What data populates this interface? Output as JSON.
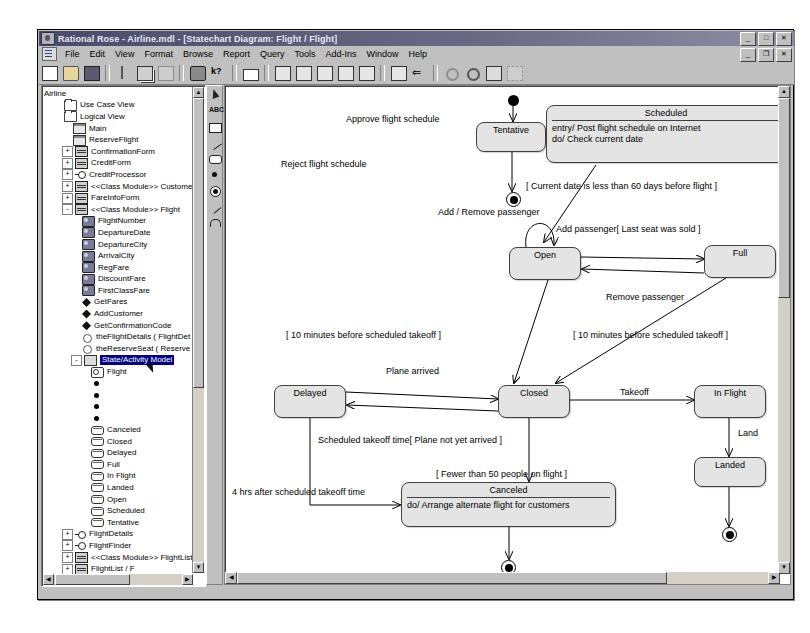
{
  "window": {
    "title": "Rational Rose - Airline.mdl - [Statechart Diagram: Flight / Flight]",
    "minimize": "_",
    "maximize": "□",
    "close": "✕",
    "mdi_minimize": "_",
    "mdi_restore": "❐",
    "mdi_close": "✕"
  },
  "menubar": {
    "items": [
      "File",
      "Edit",
      "View",
      "Format",
      "Browse",
      "Report",
      "Query",
      "Tools",
      "Add-Ins",
      "Window",
      "Help"
    ]
  },
  "toolbar": {
    "buttons": [
      {
        "name": "new-icon",
        "glyph": "new"
      },
      {
        "name": "open-icon",
        "glyph": "open"
      },
      {
        "name": "save-icon",
        "glyph": "save"
      },
      {
        "name": "cut-icon",
        "glyph": "cut"
      },
      {
        "name": "copy-icon",
        "glyph": "copy"
      },
      {
        "name": "paste-icon",
        "glyph": "paste"
      },
      {
        "name": "print-icon",
        "glyph": "print"
      },
      {
        "name": "context-help-icon",
        "glyph": "help"
      },
      {
        "name": "browse-class-icon",
        "glyph": "rect"
      },
      {
        "name": "browse-use-case-diagram-icon",
        "glyph": "diag1"
      },
      {
        "name": "browse-class-diagram-icon",
        "glyph": "diag2"
      },
      {
        "name": "browse-state-machine-diagram-icon",
        "glyph": "diag3"
      },
      {
        "name": "browse-interaction-diagram-icon",
        "glyph": "diag4"
      },
      {
        "name": "browse-component-diagram-icon",
        "glyph": "diag5"
      },
      {
        "name": "browse-parent-icon",
        "glyph": "parent"
      },
      {
        "name": "browse-previous-diagram-icon",
        "glyph": "back"
      },
      {
        "name": "zoom-in-icon",
        "glyph": "zoomin"
      },
      {
        "name": "zoom-out-icon",
        "glyph": "zoomout"
      },
      {
        "name": "fit-in-window-icon",
        "glyph": "fit"
      },
      {
        "name": "undo-fit-icon",
        "glyph": "undofit"
      }
    ]
  },
  "palette": {
    "tools": [
      {
        "name": "selection-tool",
        "glyph": "arrow"
      },
      {
        "name": "text-tool",
        "glyph": "abc"
      },
      {
        "name": "note-tool",
        "glyph": "note"
      },
      {
        "name": "anchor-note-tool",
        "glyph": "line"
      },
      {
        "name": "state-tool",
        "glyph": "state"
      },
      {
        "name": "start-state-tool",
        "glyph": "startstate"
      },
      {
        "name": "end-state-tool",
        "glyph": "endstate"
      },
      {
        "name": "state-transition-tool",
        "glyph": "transition"
      },
      {
        "name": "transition-to-self-tool",
        "glyph": "selftransition"
      }
    ]
  },
  "browser": {
    "root": "Airline",
    "nodes": [
      {
        "label": "Airline",
        "icon": "none",
        "indent": 0,
        "expander": "",
        "selected": false
      },
      {
        "label": "Use Case View",
        "icon": "folder",
        "indent": 1,
        "expander": "",
        "selected": false
      },
      {
        "label": "Logical View",
        "icon": "folder",
        "indent": 1,
        "expander": "",
        "selected": false
      },
      {
        "label": "Main",
        "icon": "pkg",
        "indent": 2,
        "expander": "",
        "selected": false
      },
      {
        "label": "ReserveFlight",
        "icon": "pkg",
        "indent": 2,
        "expander": "",
        "selected": false
      },
      {
        "label": "ConfirmationForm",
        "icon": "class",
        "indent": 2,
        "expander": "+",
        "selected": false
      },
      {
        "label": "CreditForm",
        "icon": "class",
        "indent": 2,
        "expander": "+",
        "selected": false
      },
      {
        "label": "CreditProcessor",
        "icon": "iface",
        "indent": 2,
        "expander": "+",
        "selected": false
      },
      {
        "label": "<<Class Module>> Customer",
        "icon": "class",
        "indent": 2,
        "expander": "+",
        "selected": false
      },
      {
        "label": "FareInfoForm",
        "icon": "class",
        "indent": 2,
        "expander": "+",
        "selected": false
      },
      {
        "label": "<<Class Module>> Flight",
        "icon": "class",
        "indent": 2,
        "expander": "-",
        "selected": false
      },
      {
        "label": "FlightNumber",
        "icon": "attr",
        "indent": 3,
        "expander": "",
        "selected": false
      },
      {
        "label": "DepartureDate",
        "icon": "attr",
        "indent": 3,
        "expander": "",
        "selected": false
      },
      {
        "label": "DepartureCity",
        "icon": "attr",
        "indent": 3,
        "expander": "",
        "selected": false
      },
      {
        "label": "ArrivalCity",
        "icon": "attr",
        "indent": 3,
        "expander": "",
        "selected": false
      },
      {
        "label": "RegFare",
        "icon": "attr",
        "indent": 3,
        "expander": "",
        "selected": false
      },
      {
        "label": "DiscountFare",
        "icon": "attr",
        "indent": 3,
        "expander": "",
        "selected": false
      },
      {
        "label": "FirstClassFare",
        "icon": "attr",
        "indent": 3,
        "expander": "",
        "selected": false
      },
      {
        "label": "GetFares",
        "icon": "op",
        "indent": 3,
        "expander": "",
        "selected": false
      },
      {
        "label": "AddCustomer",
        "icon": "op",
        "indent": 3,
        "expander": "",
        "selected": false
      },
      {
        "label": "GetConfirmationCode",
        "icon": "op",
        "indent": 3,
        "expander": "",
        "selected": false
      },
      {
        "label": "theFlightDetails ( FlightDet",
        "icon": "assoc",
        "indent": 3,
        "expander": "",
        "selected": false
      },
      {
        "label": "theReserveSeat ( Reserve",
        "icon": "assoc",
        "indent": 3,
        "expander": "",
        "selected": false
      },
      {
        "label": "State/Activity Model",
        "icon": "sam",
        "indent": 3,
        "expander": "-",
        "selected": true
      },
      {
        "label": "Flight",
        "icon": "flight",
        "indent": 4,
        "expander": "",
        "selected": false
      },
      {
        "label": "",
        "icon": "dot",
        "indent": 4,
        "expander": "",
        "selected": false
      },
      {
        "label": "",
        "icon": "dot",
        "indent": 4,
        "expander": "",
        "selected": false
      },
      {
        "label": "",
        "icon": "dot",
        "indent": 4,
        "expander": "",
        "selected": false
      },
      {
        "label": "",
        "icon": "dot",
        "indent": 4,
        "expander": "",
        "selected": false
      },
      {
        "label": "Canceled",
        "icon": "state",
        "indent": 4,
        "expander": "",
        "selected": false
      },
      {
        "label": "Closed",
        "icon": "state",
        "indent": 4,
        "expander": "",
        "selected": false
      },
      {
        "label": "Delayed",
        "icon": "state",
        "indent": 4,
        "expander": "",
        "selected": false
      },
      {
        "label": "Full",
        "icon": "state",
        "indent": 4,
        "expander": "",
        "selected": false
      },
      {
        "label": "In Flight",
        "icon": "state",
        "indent": 4,
        "expander": "",
        "selected": false
      },
      {
        "label": "Landed",
        "icon": "state",
        "indent": 4,
        "expander": "",
        "selected": false
      },
      {
        "label": "Open",
        "icon": "state",
        "indent": 4,
        "expander": "",
        "selected": false
      },
      {
        "label": "Scheduled",
        "icon": "state",
        "indent": 4,
        "expander": "",
        "selected": false
      },
      {
        "label": "Tentative",
        "icon": "state",
        "indent": 4,
        "expander": "",
        "selected": false
      },
      {
        "label": "FlightDetails",
        "icon": "iface",
        "indent": 2,
        "expander": "+",
        "selected": false
      },
      {
        "label": "FlightFinder",
        "icon": "iface",
        "indent": 2,
        "expander": "+",
        "selected": false
      },
      {
        "label": "<<Class Module>> FlightList",
        "icon": "class",
        "indent": 2,
        "expander": "+",
        "selected": false
      },
      {
        "label": "FlightList / F",
        "icon": "class",
        "indent": 2,
        "expander": "+",
        "selected": false
      }
    ]
  },
  "diagram": {
    "title": "Statechart Diagram: Flight / Flight",
    "states": [
      {
        "id": "tentative",
        "name": "Tentative",
        "x": 250,
        "y": 35,
        "w": 70,
        "h": 30,
        "compartment": null
      },
      {
        "id": "scheduled",
        "name": "Scheduled",
        "x": 320,
        "y": 18,
        "w": 240,
        "h": 58,
        "compartment": "entry/ Post flight schedule on Internet\ndo/ Check current date"
      },
      {
        "id": "open",
        "name": "Open",
        "x": 283,
        "y": 160,
        "w": 72,
        "h": 33,
        "compartment": null
      },
      {
        "id": "full",
        "name": "Full",
        "x": 478,
        "y": 158,
        "w": 72,
        "h": 33,
        "compartment": null
      },
      {
        "id": "delayed",
        "name": "Delayed",
        "x": 48,
        "y": 298,
        "w": 72,
        "h": 33,
        "compartment": null
      },
      {
        "id": "closed",
        "name": "Closed",
        "x": 272,
        "y": 298,
        "w": 72,
        "h": 33,
        "compartment": null
      },
      {
        "id": "inflight",
        "name": "In Flight",
        "x": 468,
        "y": 298,
        "w": 72,
        "h": 33,
        "compartment": null
      },
      {
        "id": "landed",
        "name": "Landed",
        "x": 468,
        "y": 370,
        "w": 72,
        "h": 30,
        "compartment": null
      },
      {
        "id": "canceled",
        "name": "Canceled",
        "x": 175,
        "y": 395,
        "w": 215,
        "h": 45,
        "compartment": "do/ Arrange alternate flight for customers"
      }
    ],
    "pseudostates": [
      {
        "id": "initial",
        "kind": "initial",
        "x": 282,
        "y": 8
      },
      {
        "id": "final-reject",
        "kind": "final",
        "x": 280,
        "y": 105
      },
      {
        "id": "final-canceled",
        "kind": "final",
        "x": 275,
        "y": 473
      },
      {
        "id": "final-landed",
        "kind": "final",
        "x": 496,
        "y": 440
      }
    ],
    "transition_labels": [
      {
        "id": "approve",
        "text": "Approve flight schedule",
        "x": 120,
        "y": 27
      },
      {
        "id": "reject",
        "text": "Reject flight schedule",
        "x": 55,
        "y": 72
      },
      {
        "id": "current-date",
        "text": "[ Current date is less than 60 days before flight ]",
        "x": 300,
        "y": 94
      },
      {
        "id": "add-remove",
        "text": "Add / Remove passenger",
        "x": 212,
        "y": 120
      },
      {
        "id": "add-passenger",
        "text": "Add passenger[ Last seat was sold ]",
        "x": 330,
        "y": 137
      },
      {
        "id": "remove-passenger",
        "text": "Remove passenger",
        "x": 380,
        "y": 205
      },
      {
        "id": "ten-min-open",
        "text": "[ 10 minutes before scheduled takeoff ]",
        "x": 60,
        "y": 243
      },
      {
        "id": "ten-min-full",
        "text": "[ 10 minutes before scheduled takeoff ]",
        "x": 347,
        "y": 243
      },
      {
        "id": "plane-arrived",
        "text": "Plane arrived",
        "x": 160,
        "y": 279
      },
      {
        "id": "takeoff",
        "text": "Takeoff",
        "x": 394,
        "y": 300
      },
      {
        "id": "land",
        "text": "Land",
        "x": 512,
        "y": 341
      },
      {
        "id": "sched-takeoff",
        "text": "Scheduled takeoff time[ Plane not yet arrived ]",
        "x": 92,
        "y": 348
      },
      {
        "id": "fewer-50",
        "text": "[ Fewer than 50 people on flight ]",
        "x": 210,
        "y": 382
      },
      {
        "id": "four-hrs",
        "text": "4 hrs after scheduled takeoff time",
        "x": 6,
        "y": 400
      }
    ]
  }
}
